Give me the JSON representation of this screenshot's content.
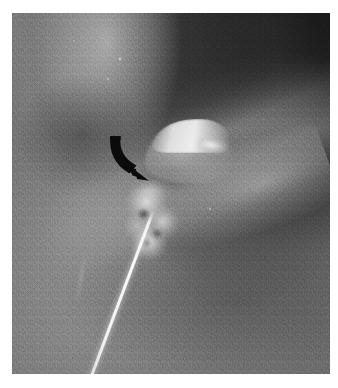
{
  "image": {
    "modality": "radiograph",
    "color_mode": "grayscale",
    "plate_background": "#6e6e6e",
    "page_background": "#ffffff",
    "margins_px": {
      "left": 12,
      "top": 13,
      "right": 8,
      "bottom": 14
    },
    "plate_size_px": {
      "width": 318,
      "height": 361
    }
  },
  "annotations": [
    {
      "name": "curved-arrow",
      "kind": "curved-arrow",
      "color": "#0b0b0b",
      "points_to": {
        "x": 133,
        "y": 163
      },
      "tail_start": {
        "x": 100,
        "y": 127
      },
      "direction": "down-right"
    }
  ],
  "anatomy": [
    {
      "name": "cortex-upper-left",
      "label": "bright cortical column (upper left)",
      "tone": "#cdcdcd"
    },
    {
      "name": "dark-upper-right",
      "label": "dark joint space / air (upper right)",
      "tone": "#141414"
    },
    {
      "name": "tubercle",
      "label": "bright dome-shaped tubercle (centre)",
      "tone": "#eeeeee"
    },
    {
      "name": "calcific-fragment",
      "label": "irregular bright calcific fragment",
      "tone": "#e4e4e4"
    },
    {
      "name": "femoral-neck-band",
      "label": "diagonal bright bone band (lower right)",
      "tone": "#bababa"
    },
    {
      "name": "soft-tissue-field",
      "label": "surrounding soft-tissue field",
      "tone": "#6e6e6e"
    }
  ],
  "instruments": [
    {
      "name": "needle",
      "label": "radiopaque needle / guide-wire",
      "tone": "#fbfbfb",
      "tip": {
        "x": 183,
        "y": 198
      },
      "exit": {
        "x": 114,
        "y": 374
      },
      "angle_deg": 20.5
    }
  ]
}
